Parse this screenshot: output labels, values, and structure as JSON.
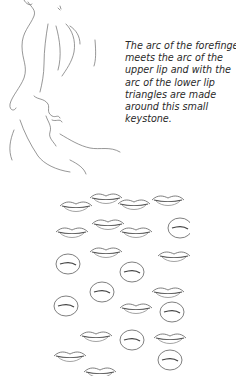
{
  "page": {
    "type": "book-page",
    "background": "#ffffff"
  },
  "illustration_top": {
    "subject": "pencil sketch of profile with forefinger touching lips",
    "ink_color": "#555555"
  },
  "caption": {
    "lines": [
      "The arc of the forefinger",
      "meets the arc of the",
      "upper lip and with the",
      "arc of the lower lip",
      "triangles are made",
      "around this small",
      "keystone."
    ],
    "text_color": "#2a2a2a"
  },
  "illustration_bottom": {
    "subject": "grid of small pencil sketches of lips and mouths",
    "columns": 3,
    "ink_color": "#444444"
  }
}
